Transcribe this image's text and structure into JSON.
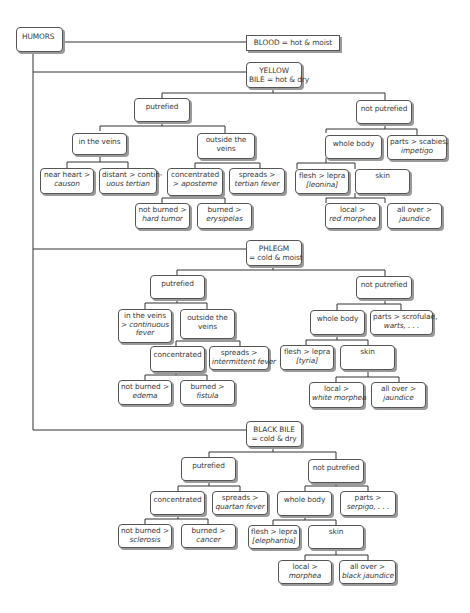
{
  "root": {
    "label": "HUMORS"
  },
  "blood": {
    "label": "BLOOD = hot & moist"
  },
  "yellow_bile": {
    "label_line1": "YELLOW",
    "label_line2": "BILE = hot & dry",
    "putrefied": {
      "label": "putrefied",
      "in_veins": {
        "label": "in the veins",
        "near_heart": {
          "line1": "near heart >",
          "line2": "causon"
        },
        "distant": {
          "line1": "distant > contin-",
          "line2": "uous tertian"
        }
      },
      "outside_veins": {
        "line1": "outside the",
        "line2": "veins",
        "concentrated": {
          "line1": "concentrated",
          "line2": "> aposteme",
          "not_burned": {
            "line1": "not burned >",
            "line2": "hard tumor"
          },
          "burned": {
            "line1": "burned >",
            "line2": "erysipelas"
          }
        },
        "spreads": {
          "line1": "spreads >",
          "line2": "tertian fever"
        }
      }
    },
    "not_putrefied": {
      "label": "not putrefied",
      "whole_body": {
        "label": "whole body",
        "flesh": {
          "line1": "flesh > lepra",
          "line2": "[leonina]"
        },
        "skin": {
          "label": "skin",
          "local": {
            "line1": "local >",
            "line2": "red morphea"
          },
          "all_over": {
            "line1": "all over >",
            "line2": "jaundice"
          }
        }
      },
      "parts": {
        "line1": "parts > scabies,",
        "line2": "impetigo"
      }
    }
  },
  "phlegm": {
    "label_line1": "PHLEGM",
    "label_line2": "= cold & moist",
    "putrefied": {
      "label": "putrefied",
      "in_veins": {
        "line1": "in the veins",
        "line2": "> continuous",
        "line3": "fever"
      },
      "outside_veins": {
        "line1": "outside the",
        "line2": "veins",
        "concentrated": {
          "label": "concentrated",
          "not_burned": {
            "line1": "not burned >",
            "line2": "edema"
          },
          "burned": {
            "line1": "burned >",
            "line2": "fistula"
          }
        },
        "spreads": {
          "line1": "spreads >",
          "line2": "intermittent fever"
        }
      }
    },
    "not_putrefied": {
      "label": "not putrefied",
      "whole_body": {
        "label": "whole body",
        "flesh": {
          "line1": "flesh > lepra",
          "line2": "[tyria]"
        },
        "skin": {
          "label": "skin",
          "local": {
            "line1": "local >",
            "line2": "white morphea"
          },
          "all_over": {
            "line1": "all over >",
            "line2": "jaundice"
          }
        }
      },
      "parts": {
        "line1": "parts > scrofulae,",
        "line2": "warts, . . ."
      }
    }
  },
  "black_bile": {
    "label_line1": "BLACK BILE",
    "label_line2": "= cold & dry",
    "putrefied": {
      "label": "putrefied",
      "concentrated": {
        "label": "concentrated",
        "not_burned": {
          "line1": "not burned >",
          "line2": "sclerosis"
        },
        "burned": {
          "line1": "burned >",
          "line2": "cancer"
        }
      },
      "spreads": {
        "line1": "spreads >",
        "line2": "quartan fever"
      }
    },
    "not_putrefied": {
      "label": "not putrefied",
      "whole_body": {
        "label": "whole body",
        "flesh": {
          "line1": "flesh > lepra",
          "line2": "[elephantia]"
        },
        "skin": {
          "label": "skin",
          "local": {
            "line1": "local >",
            "line2": "morphea"
          },
          "all_over": {
            "line1": "all over >",
            "line2": "black jaundice"
          }
        }
      },
      "parts": {
        "line1": "parts >",
        "line2": "serpigo, . . ."
      }
    }
  },
  "colors": {
    "line": "#333333",
    "box_border": "#555555",
    "shadow": "#9a9a9a",
    "text": "#3a3a3a"
  }
}
